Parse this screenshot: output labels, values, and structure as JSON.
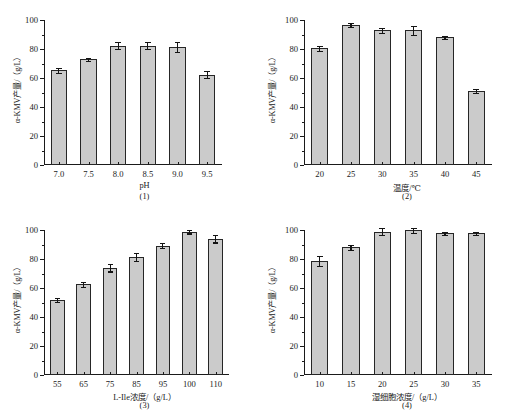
{
  "figure": {
    "background": "#ffffff",
    "bar_fill": "#cbcbcb",
    "bar_edge": "#262626",
    "axis_color": "#1a1a1a"
  },
  "chart_data": [
    {
      "type": "bar",
      "panel_id": "(1)",
      "title": "",
      "xlabel": "pH",
      "ylabel": "α-KMV产量/（g/L）",
      "categories": [
        "7.0",
        "7.5",
        "8.0",
        "8.5",
        "9.0",
        "9.5"
      ],
      "values": [
        65.2,
        72.8,
        82.4,
        82.3,
        81.4,
        62.4
      ],
      "errors": [
        1.5,
        1.0,
        2.2,
        2.4,
        3.2,
        2.6
      ],
      "ylim": [
        0,
        100
      ],
      "yticks": [
        0,
        20,
        40,
        60,
        80,
        100
      ],
      "ytick_labels": [
        "0",
        "20",
        "40",
        "60",
        "80",
        "100"
      ],
      "grid": false,
      "legend": "none"
    },
    {
      "type": "bar",
      "panel_id": "(2)",
      "title": "",
      "xlabel": "温度/℃",
      "ylabel": "α-KMV产量/（g/L）",
      "categories": [
        "20",
        "25",
        "30",
        "35",
        "40",
        "45"
      ],
      "values": [
        80.5,
        96.8,
        93.0,
        92.8,
        88.0,
        51.0
      ],
      "errors": [
        1.8,
        1.4,
        1.8,
        3.0,
        1.2,
        1.6
      ],
      "ylim": [
        0,
        100
      ],
      "yticks": [
        0,
        20,
        40,
        60,
        80,
        100
      ],
      "ytick_labels": [
        "0",
        "20",
        "40",
        "60",
        "80",
        "100"
      ],
      "grid": false,
      "legend": "none"
    },
    {
      "type": "bar",
      "panel_id": "(3)",
      "title": "",
      "xlabel": "L-Ile浓度/（g/L）",
      "ylabel": "α-KMV产量/（g/L）",
      "categories": [
        "55",
        "65",
        "75",
        "85",
        "95",
        "100",
        "110"
      ],
      "values": [
        52.0,
        62.5,
        74.0,
        81.5,
        89.2,
        98.8,
        94.0
      ],
      "errors": [
        1.4,
        1.8,
        2.6,
        2.6,
        1.8,
        1.2,
        2.6
      ],
      "ylim": [
        0,
        100
      ],
      "yticks": [
        0,
        20,
        40,
        60,
        80,
        100
      ],
      "ytick_labels": [
        "0",
        "20",
        "40",
        "60",
        "80",
        "100"
      ],
      "grid": false,
      "legend": "none"
    },
    {
      "type": "bar",
      "panel_id": "(4)",
      "title": "",
      "xlabel": "湿细胞浓度/（g/L）",
      "ylabel": "α-KMV产量/（g/L）",
      "categories": [
        "10",
        "15",
        "20",
        "25",
        "30",
        "35"
      ],
      "values": [
        78.5,
        88.0,
        98.8,
        99.8,
        97.8,
        97.8
      ],
      "errors": [
        3.6,
        1.6,
        2.4,
        1.6,
        1.0,
        1.0
      ],
      "ylim": [
        0,
        100
      ],
      "yticks": [
        0,
        20,
        40,
        60,
        80,
        100
      ],
      "ytick_labels": [
        "0",
        "20",
        "40",
        "60",
        "80",
        "100"
      ],
      "grid": false,
      "legend": "none"
    }
  ]
}
